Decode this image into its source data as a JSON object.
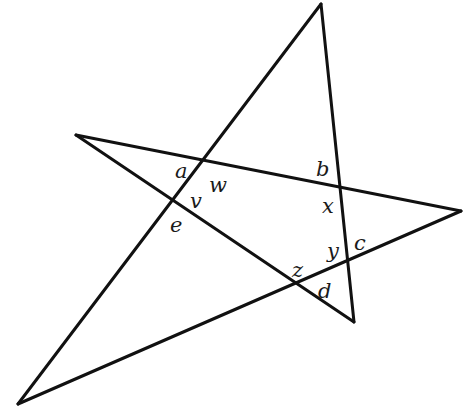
{
  "diagram": {
    "type": "self-intersecting pentagram (five-pointed star)",
    "stroke_color": "#111111",
    "background": "#ffffff",
    "vertices": {
      "top": [
        321,
        4
      ],
      "left": [
        76,
        135
      ],
      "right": [
        461,
        211
      ],
      "bottom_right": [
        354,
        322
      ],
      "bottom_left": [
        18,
        404
      ]
    },
    "segments": [
      {
        "from": "bottom_left",
        "to": "top"
      },
      {
        "from": "top",
        "to": "bottom_right"
      },
      {
        "from": "bottom_right",
        "to": "left"
      },
      {
        "from": "left",
        "to": "right"
      },
      {
        "from": "right",
        "to": "bottom_left"
      }
    ],
    "labels": [
      {
        "text": "a",
        "x": 175,
        "y": 178
      },
      {
        "text": "w",
        "x": 209,
        "y": 192
      },
      {
        "text": "b",
        "x": 316,
        "y": 176
      },
      {
        "text": "x",
        "x": 322,
        "y": 213
      },
      {
        "text": "v",
        "x": 190,
        "y": 208
      },
      {
        "text": "e",
        "x": 170,
        "y": 232
      },
      {
        "text": "y",
        "x": 327,
        "y": 258
      },
      {
        "text": "c",
        "x": 354,
        "y": 250
      },
      {
        "text": "z",
        "x": 292,
        "y": 277
      },
      {
        "text": "d",
        "x": 318,
        "y": 298
      }
    ]
  }
}
